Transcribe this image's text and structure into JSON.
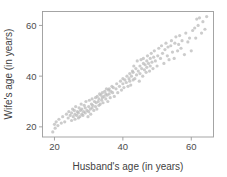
{
  "figure": {
    "background": "#ffffff",
    "frame_color": "#9b9b9b",
    "point_color": "#b9b9b9",
    "point_opacity": 0.72,
    "point_radius": 1.6,
    "width": 227,
    "height": 177
  },
  "chart_data": {
    "type": "scatter",
    "title": "",
    "xlabel": "Husband's age (in years)",
    "ylabel": "Wife's age (in years)",
    "xticks": [
      20,
      40,
      60
    ],
    "yticks": [
      20,
      40,
      60
    ],
    "xticklabels": [
      "20",
      "40",
      "60"
    ],
    "yticklabels": [
      "20",
      "40",
      "60"
    ],
    "xlim": [
      16.5,
      66.5
    ],
    "ylim": [
      16.0,
      65.5
    ],
    "grid": false,
    "legend": null,
    "series": [
      {
        "name": "couples",
        "marker": "circle",
        "color": "#b9b9b9",
        "n": 170,
        "x": [
          19.5,
          20.0,
          20.2,
          20.5,
          21.0,
          21.3,
          22.0,
          22.4,
          23.0,
          23.5,
          24.0,
          24.2,
          24.6,
          25.0,
          25.0,
          25.3,
          25.5,
          25.8,
          26.0,
          26.0,
          26.2,
          26.5,
          26.7,
          27.0,
          27.0,
          27.2,
          27.4,
          27.6,
          27.8,
          28.0,
          28.0,
          28.3,
          28.5,
          28.7,
          29.0,
          29.0,
          29.2,
          29.5,
          29.8,
          30.0,
          30.0,
          30.2,
          30.5,
          30.6,
          30.8,
          31.0,
          31.0,
          31.2,
          31.5,
          31.7,
          32.0,
          32.0,
          32.2,
          32.4,
          32.5,
          32.8,
          33.0,
          33.0,
          33.2,
          33.4,
          33.6,
          33.8,
          34.0,
          34.0,
          34.2,
          34.5,
          34.7,
          35.0,
          35.0,
          35.2,
          35.4,
          35.6,
          35.8,
          36.0,
          36.0,
          36.3,
          36.5,
          36.8,
          37.0,
          37.2,
          37.5,
          38.0,
          38.2,
          38.5,
          39.0,
          39.3,
          39.6,
          40.0,
          40.0,
          40.3,
          40.6,
          41.0,
          41.2,
          41.5,
          41.8,
          42.0,
          42.0,
          42.3,
          42.5,
          42.8,
          43.0,
          43.0,
          43.2,
          43.5,
          43.8,
          44.0,
          44.2,
          44.5,
          44.8,
          45.0,
          45.0,
          45.3,
          45.5,
          45.8,
          46.0,
          46.0,
          46.3,
          46.5,
          46.8,
          47.0,
          47.0,
          47.2,
          47.5,
          47.8,
          48.0,
          48.0,
          48.3,
          48.5,
          48.8,
          49.0,
          49.2,
          49.5,
          50.0,
          50.2,
          50.5,
          51.0,
          51.3,
          51.6,
          52.0,
          52.3,
          52.6,
          53.0,
          53.2,
          53.5,
          54.0,
          54.2,
          54.5,
          55.0,
          55.2,
          55.5,
          56.0,
          56.3,
          56.6,
          57.0,
          57.3,
          58.0,
          58.4,
          59.0,
          59.5,
          60.0,
          60.4,
          61.0,
          61.3,
          61.6,
          62.0,
          62.4,
          63.0,
          63.4,
          64.0,
          64.5
        ],
        "y": [
          18.0,
          21.0,
          19.5,
          22.0,
          20.5,
          23.0,
          21.5,
          24.0,
          22.0,
          25.0,
          23.5,
          26.0,
          24.5,
          22.5,
          25.5,
          27.0,
          24.0,
          26.5,
          23.0,
          25.0,
          28.0,
          24.5,
          26.0,
          23.5,
          25.5,
          27.5,
          24.0,
          26.5,
          29.0,
          25.0,
          27.0,
          24.5,
          26.0,
          28.5,
          25.5,
          27.5,
          30.0,
          26.5,
          24.0,
          26.0,
          28.0,
          30.5,
          27.0,
          25.0,
          29.0,
          27.5,
          31.0,
          28.5,
          26.5,
          30.0,
          28.0,
          31.5,
          29.5,
          27.0,
          32.0,
          30.0,
          28.5,
          31.0,
          33.0,
          29.0,
          32.5,
          30.5,
          31.5,
          33.5,
          29.5,
          32.0,
          34.0,
          31.0,
          33.0,
          35.0,
          32.5,
          30.0,
          34.5,
          33.0,
          35.0,
          31.5,
          34.0,
          36.0,
          33.5,
          35.5,
          32.0,
          35.0,
          37.0,
          33.5,
          36.0,
          38.0,
          34.5,
          37.0,
          39.0,
          35.5,
          38.5,
          37.5,
          40.0,
          36.0,
          39.0,
          38.0,
          41.0,
          36.5,
          40.0,
          42.0,
          38.5,
          41.5,
          44.0,
          39.0,
          43.0,
          40.5,
          46.0,
          42.0,
          38.0,
          44.0,
          41.0,
          46.5,
          43.0,
          40.0,
          45.0,
          47.0,
          42.5,
          44.5,
          41.5,
          46.0,
          43.5,
          48.0,
          45.0,
          42.0,
          47.0,
          44.0,
          49.0,
          45.5,
          43.0,
          47.5,
          50.0,
          46.0,
          44.0,
          48.0,
          51.0,
          47.0,
          52.0,
          49.0,
          45.0,
          50.5,
          53.0,
          48.0,
          51.5,
          46.5,
          52.0,
          54.0,
          49.5,
          47.0,
          53.0,
          55.5,
          50.0,
          52.5,
          56.0,
          51.0,
          54.0,
          48.5,
          57.0,
          53.5,
          55.0,
          50.0,
          58.0,
          59.0,
          55.0,
          62.5,
          60.0,
          63.0,
          57.0,
          61.5,
          58.5,
          63.5
        ]
      }
    ]
  }
}
